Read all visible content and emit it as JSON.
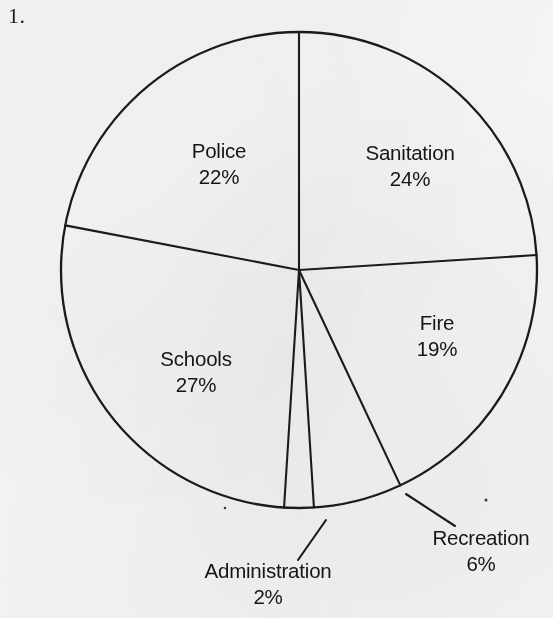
{
  "page": {
    "item_number": "1.",
    "background_color": "#f6f5f3",
    "ink_color": "#1b1b1b"
  },
  "chart_data": {
    "type": "pie",
    "title": "",
    "subtitle": "",
    "xlabel": "",
    "ylabel": "",
    "legend_position": "none",
    "grid": false,
    "labels_inside": true,
    "start_angle_deg": 0,
    "direction": "clockwise",
    "categories": [
      "Sanitation",
      "Fire",
      "Recreation",
      "Administration",
      "Schools",
      "Police"
    ],
    "values": [
      24,
      19,
      6,
      2,
      27,
      22
    ],
    "unit": "%",
    "total": 100,
    "slices": [
      {
        "name": "Sanitation",
        "value": 24,
        "value_label": "24%",
        "start_deg": 0,
        "end_deg": 86.4,
        "label_placement": "inside",
        "label_x": 410,
        "label_y": 160,
        "value_x": 410,
        "value_y": 186
      },
      {
        "name": "Fire",
        "value": 19,
        "value_label": "19%",
        "start_deg": 86.4,
        "end_deg": 154.8,
        "label_placement": "inside",
        "label_x": 437,
        "label_y": 330,
        "value_x": 437,
        "value_y": 356
      },
      {
        "name": "Recreation",
        "value": 6,
        "value_label": "6%",
        "start_deg": 154.8,
        "end_deg": 176.4,
        "label_placement": "outside-leader",
        "label_x": 481,
        "label_y": 545,
        "value_x": 481,
        "value_y": 571,
        "leader_from_x": 406,
        "leader_from_y": 494,
        "leader_to_x": 455,
        "leader_to_y": 526
      },
      {
        "name": "Administration",
        "value": 2,
        "value_label": "2%",
        "start_deg": 176.4,
        "end_deg": 183.6,
        "label_placement": "outside-leader",
        "label_x": 268,
        "label_y": 578,
        "value_x": 268,
        "value_y": 604,
        "leader_from_x": 326,
        "leader_from_y": 520,
        "leader_to_x": 298,
        "leader_to_y": 560
      },
      {
        "name": "Schools",
        "value": 27,
        "value_label": "27%",
        "start_deg": 183.6,
        "end_deg": 280.8,
        "label_placement": "inside",
        "label_x": 196,
        "label_y": 366,
        "value_x": 196,
        "value_y": 392
      },
      {
        "name": "Police",
        "value": 22,
        "value_label": "22%",
        "start_deg": 280.8,
        "end_deg": 360,
        "label_placement": "inside",
        "label_x": 219,
        "label_y": 158,
        "value_x": 219,
        "value_y": 184
      }
    ],
    "geometry": {
      "center_x": 299,
      "center_y": 270,
      "radius": 238
    }
  }
}
